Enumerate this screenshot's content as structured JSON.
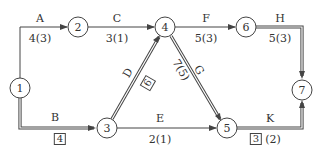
{
  "diagram": {
    "type": "activity-on-arrow network",
    "colors": {
      "line": "#444444",
      "background": "#ffffff"
    },
    "nodes": [
      {
        "id": "1",
        "x": 20,
        "y": 88
      },
      {
        "id": "2",
        "x": 78,
        "y": 27
      },
      {
        "id": "3",
        "x": 107,
        "y": 128
      },
      {
        "id": "4",
        "x": 165,
        "y": 27
      },
      {
        "id": "5",
        "x": 227,
        "y": 128
      },
      {
        "id": "6",
        "x": 246,
        "y": 27
      },
      {
        "id": "7",
        "x": 302,
        "y": 90
      }
    ],
    "activities": [
      {
        "name": "A",
        "from": "1",
        "to": "2",
        "duration": "4(3)",
        "critical": false
      },
      {
        "name": "B",
        "from": "1",
        "to": "3",
        "duration": "4",
        "boxed": true,
        "critical": true
      },
      {
        "name": "C",
        "from": "2",
        "to": "4",
        "duration": "3(1)",
        "critical": false
      },
      {
        "name": "D",
        "from": "3",
        "to": "4",
        "duration": "6",
        "boxed": true,
        "critical": true
      },
      {
        "name": "E",
        "from": "3",
        "to": "5",
        "duration": "2(1)",
        "critical": false
      },
      {
        "name": "F",
        "from": "4",
        "to": "6",
        "duration": "5(3)",
        "critical": false
      },
      {
        "name": "G",
        "from": "4",
        "to": "5",
        "duration": "7(5)",
        "critical": true
      },
      {
        "name": "H",
        "from": "6",
        "to": "7",
        "duration": "5(3)",
        "critical": true
      },
      {
        "name": "K",
        "from": "5",
        "to": "7",
        "duration": "3",
        "duration_extra": "(2)",
        "boxed": true,
        "critical": true
      }
    ]
  },
  "labels": {
    "n1": "1",
    "n2": "2",
    "n3": "3",
    "n4": "4",
    "n5": "5",
    "n6": "6",
    "n7": "7",
    "A": "A",
    "A_dur": "4(3)",
    "B": "B",
    "B_dur": "4",
    "C": "C",
    "C_dur": "3(1)",
    "D": "D",
    "D_dur": "6",
    "E": "E",
    "E_dur": "2(1)",
    "F": "F",
    "F_dur": "5(3)",
    "G": "G",
    "G_dur": "7(5)",
    "H": "H",
    "H_dur": "5(3)",
    "K": "K",
    "K_dur": "3",
    "K_extra": "(2)"
  }
}
